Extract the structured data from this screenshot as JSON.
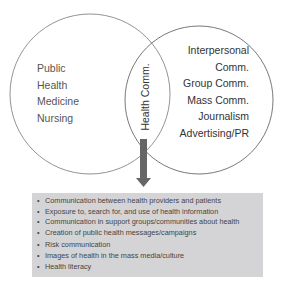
{
  "diagram": {
    "left_circle": {
      "labels": [
        "Public",
        "Health",
        "Medicine",
        "Nursing"
      ]
    },
    "right_circle": {
      "labels": [
        "Interpersonal",
        "Comm.",
        "Group Comm.",
        "Mass Comm.",
        "Journalism",
        "Advertising/PR"
      ]
    },
    "intersection": {
      "label": "Health Comm."
    },
    "arrow": {
      "color": "#666666",
      "direction": "down"
    },
    "box": {
      "background": "#d4d4d6",
      "items": [
        "Communication between health providers and patients",
        "Exposure to, search for, and use of health information",
        "Communication in support groups/communities about health",
        "Creation of public health messages/campaigns",
        "Risk communication",
        "Images of health in the mass media/culture",
        "Health literacy"
      ]
    }
  }
}
